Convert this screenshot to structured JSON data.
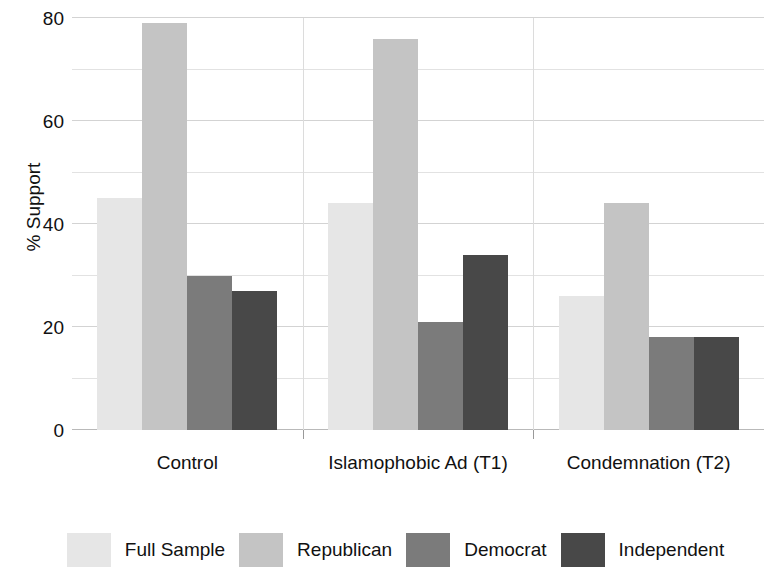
{
  "chart_data": {
    "type": "bar",
    "title": "",
    "subtitle": "",
    "xlabel": "",
    "ylabel": "% Support",
    "ylim": [
      0,
      80
    ],
    "yticks": [
      80,
      60,
      40,
      20,
      0
    ],
    "minor_gridlines": [
      70,
      50,
      30,
      10
    ],
    "grid": true,
    "legend_position": "bottom",
    "categories": [
      "Control",
      "Islamophobic Ad (T1)",
      "Condemnation (T2)"
    ],
    "series": [
      {
        "name": "Full Sample",
        "color": "#e6e6e6",
        "values": [
          45,
          44,
          26
        ]
      },
      {
        "name": "Republican",
        "color": "#c4c4c4",
        "values": [
          79,
          76,
          44
        ]
      },
      {
        "name": "Democrat",
        "color": "#7b7b7b",
        "values": [
          30,
          21,
          18
        ]
      },
      {
        "name": "Independent",
        "color": "#484848",
        "values": [
          27,
          34,
          18
        ]
      }
    ]
  },
  "axis": {
    "y_title": "% Support",
    "y_tick_labels": [
      "80",
      "60",
      "40",
      "20",
      "0"
    ],
    "x_tick_labels": [
      "Control",
      "Islamophobic Ad (T1)",
      "Condemnation (T2)"
    ]
  },
  "legend": {
    "entries": [
      {
        "label": "Full Sample",
        "color": "#e6e6e6"
      },
      {
        "label": "Republican",
        "color": "#c4c4c4"
      },
      {
        "label": "Democrat",
        "color": "#7b7b7b"
      },
      {
        "label": "Independent",
        "color": "#484848"
      }
    ]
  }
}
